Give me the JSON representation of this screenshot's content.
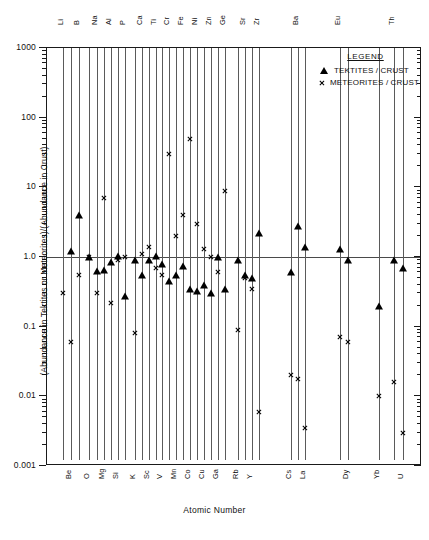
{
  "chart_data": {
    "type": "scatter",
    "title": "",
    "xlabel": "Atomic Number",
    "ylabel": "(Abundance in Tektites or Meteorites)/(Abundance in Crust)",
    "yscale": "log",
    "ylim": [
      0.001,
      1000
    ],
    "ytick_labels": [
      "1000",
      "100",
      "10",
      "1.0",
      "0.1",
      "0.01",
      "0.001"
    ],
    "ytick_values": [
      1000,
      100,
      10,
      1.0,
      0.1,
      0.01,
      0.001
    ],
    "grid": false,
    "reference_line": 1.0,
    "legend_position": "top-right",
    "legend_title": "LEGEND",
    "series": [
      {
        "name": "TEKTITES / CRUST",
        "marker": "triangle",
        "color": "#000000"
      },
      {
        "name": "METEORITES / CRUST",
        "marker": "x",
        "color": "#000000"
      }
    ],
    "elements": [
      {
        "symbol": "Li",
        "z": 3,
        "label_pos": "top",
        "x": 62,
        "tektite": null,
        "meteorite": 0.3
      },
      {
        "symbol": "Be",
        "z": 4,
        "label_pos": "bot",
        "x": 70,
        "tektite": 1.2,
        "meteorite": 0.06
      },
      {
        "symbol": "B",
        "z": 5,
        "label_pos": "top",
        "x": 78,
        "tektite": 4.0,
        "meteorite": 0.55
      },
      {
        "symbol": "O",
        "z": 8,
        "label_pos": "bot",
        "x": 88,
        "tektite": 1.0,
        "meteorite": 1.0
      },
      {
        "symbol": "Na",
        "z": 11,
        "label_pos": "top",
        "x": 96,
        "tektite": 0.62,
        "meteorite": 0.3
      },
      {
        "symbol": "Mg",
        "z": 12,
        "label_pos": "bot",
        "x": 103,
        "tektite": 0.65,
        "meteorite": 7.0
      },
      {
        "symbol": "Al",
        "z": 13,
        "label_pos": "top",
        "x": 110,
        "tektite": 0.85,
        "meteorite": 0.22
      },
      {
        "symbol": "Si",
        "z": 14,
        "label_pos": "bot",
        "x": 117,
        "tektite": 1.05,
        "meteorite": 0.9
      },
      {
        "symbol": "P",
        "z": 15,
        "label_pos": "top",
        "x": 124,
        "tektite": 0.28,
        "meteorite": 1.0
      },
      {
        "symbol": "K",
        "z": 19,
        "label_pos": "bot",
        "x": 134,
        "tektite": 0.9,
        "meteorite": 0.08
      },
      {
        "symbol": "Ca",
        "z": 20,
        "label_pos": "top",
        "x": 141,
        "tektite": 0.55,
        "meteorite": 1.1
      },
      {
        "symbol": "Sc",
        "z": 21,
        "label_pos": "bot",
        "x": 148,
        "tektite": 0.9,
        "meteorite": 1.4
      },
      {
        "symbol": "Ti",
        "z": 22,
        "label_pos": "top",
        "x": 155,
        "tektite": 1.05,
        "meteorite": 0.7
      },
      {
        "symbol": "V",
        "z": 23,
        "label_pos": "bot",
        "x": 161,
        "tektite": 0.8,
        "meteorite": 0.55
      },
      {
        "symbol": "Cr",
        "z": 24,
        "label_pos": "top",
        "x": 168,
        "tektite": 0.45,
        "meteorite": 30.0
      },
      {
        "symbol": "Mn",
        "z": 25,
        "label_pos": "bot",
        "x": 175,
        "tektite": 0.55,
        "meteorite": 2.0
      },
      {
        "symbol": "Fe",
        "z": 26,
        "label_pos": "top",
        "x": 182,
        "tektite": 0.75,
        "meteorite": 4.0
      },
      {
        "symbol": "Co",
        "z": 27,
        "label_pos": "bot",
        "x": 189,
        "tektite": 0.35,
        "meteorite": 50.0
      },
      {
        "symbol": "Ni",
        "z": 28,
        "label_pos": "top",
        "x": 196,
        "tektite": 0.32,
        "meteorite": 3.0
      },
      {
        "symbol": "Cu",
        "z": 29,
        "label_pos": "bot",
        "x": 203,
        "tektite": 0.4,
        "meteorite": 1.3
      },
      {
        "symbol": "Zn",
        "z": 30,
        "label_pos": "top",
        "x": 210,
        "tektite": 0.3,
        "meteorite": 1.0
      },
      {
        "symbol": "Ga",
        "z": 31,
        "label_pos": "bot",
        "x": 217,
        "tektite": 1.0,
        "meteorite": 0.6
      },
      {
        "symbol": "Ge",
        "z": 32,
        "label_pos": "top",
        "x": 224,
        "tektite": 0.35,
        "meteorite": 9.0
      },
      {
        "symbol": "Rb",
        "z": 37,
        "label_pos": "bot",
        "x": 237,
        "tektite": 0.9,
        "meteorite": 0.09
      },
      {
        "symbol": "Sr",
        "z": 38,
        "label_pos": "top",
        "x": 244,
        "tektite": 0.55,
        "meteorite": 0.5
      },
      {
        "symbol": "Y",
        "z": 39,
        "label_pos": "bot",
        "x": 251,
        "tektite": 0.5,
        "meteorite": 0.35
      },
      {
        "symbol": "Zr",
        "z": 40,
        "label_pos": "top",
        "x": 258,
        "tektite": 2.2,
        "meteorite": 0.006
      },
      {
        "symbol": "Cs",
        "z": 55,
        "label_pos": "bot",
        "x": 290,
        "tektite": 0.6,
        "meteorite": 0.02
      },
      {
        "symbol": "Ba",
        "z": 56,
        "label_pos": "top",
        "x": 297,
        "tektite": 2.8,
        "meteorite": 0.018
      },
      {
        "symbol": "La",
        "z": 57,
        "label_pos": "bot",
        "x": 304,
        "tektite": 1.4,
        "meteorite": 0.0035
      },
      {
        "symbol": "Eu",
        "z": 63,
        "label_pos": "top",
        "x": 339,
        "tektite": 1.3,
        "meteorite": 0.07
      },
      {
        "symbol": "Dy",
        "z": 66,
        "label_pos": "bot",
        "x": 347,
        "tektite": 0.9,
        "meteorite": 0.06
      },
      {
        "symbol": "Yb",
        "z": 70,
        "label_pos": "bot",
        "x": 378,
        "tektite": 0.2,
        "meteorite": 0.01
      },
      {
        "symbol": "Th",
        "z": 90,
        "label_pos": "top",
        "x": 393,
        "tektite": 0.9,
        "meteorite": 0.016
      },
      {
        "symbol": "U",
        "z": 92,
        "label_pos": "bot",
        "x": 402,
        "tektite": 0.7,
        "meteorite": 0.003
      }
    ]
  },
  "legend": {
    "title": "LEGEND",
    "rows": [
      {
        "symbol": "triangle-marker",
        "label": "TEKTITES / CRUST"
      },
      {
        "symbol": "x-marker",
        "label": "METEORITES / CRUST"
      }
    ]
  },
  "axes": {
    "x_title": "Atomic Number",
    "y_title": "(Abundance in Tektites or Meteorites)/(Abundance in Crust)",
    "y_labels": [
      "1000",
      "100",
      "10",
      "1.0",
      "0.1",
      "0.01",
      "0.001"
    ]
  }
}
